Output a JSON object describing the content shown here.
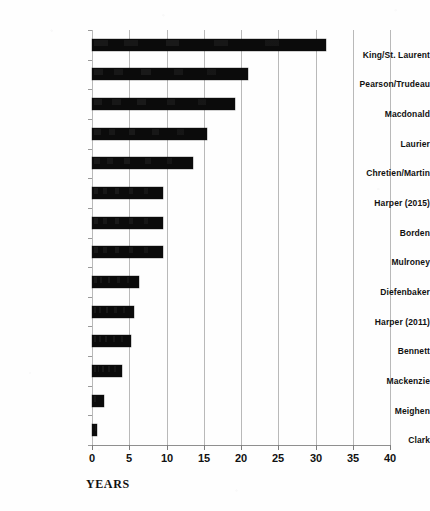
{
  "chart_data": {
    "type": "bar",
    "orientation": "horizontal",
    "title": "",
    "subtitle": "",
    "xlabel": "YEARS",
    "ylabel": "",
    "xlim": [
      0,
      40
    ],
    "xticks": [
      0,
      5,
      10,
      15,
      20,
      25,
      30,
      35,
      40
    ],
    "grid": true,
    "legend": null,
    "bar_color": "#0b0b0b",
    "grid_color": "#b9b9b9",
    "axis_color": "#8f8f8f",
    "categories": [
      "King/St. Laurent",
      "Pearson/Trudeau",
      "Macdonald",
      "Laurier",
      "Chretien/Martin",
      "Harper (2015)",
      "Borden",
      "Mulroney",
      "Diefenbaker",
      "Harper (2011)",
      "Bennett",
      "Mackenzie",
      "Meighen",
      "Clark"
    ],
    "values": [
      31.4,
      21.0,
      19.2,
      15.5,
      13.6,
      9.5,
      9.5,
      9.5,
      6.3,
      5.6,
      5.3,
      4.0,
      1.6,
      0.7
    ]
  }
}
